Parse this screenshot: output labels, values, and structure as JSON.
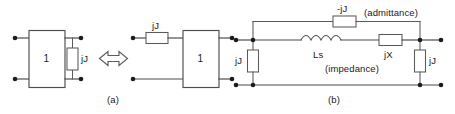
{
  "figure": {
    "type": "circuit-equivalence-diagram",
    "captions": [
      {
        "id": "a",
        "text": "(a)"
      },
      {
        "id": "b",
        "text": "(b)"
      }
    ],
    "colors": {
      "wire": "#4d4d4d",
      "component_outline": "#5a5a5a",
      "node_dot": "#1c1c1c",
      "text": "#1a1a1a",
      "background": "#ffffff"
    }
  },
  "panel_a": {
    "caption": "(a)",
    "left_network": {
      "block_label": "1",
      "shunt_element_label": "jJ",
      "terminal_count": 4
    },
    "equivalence_symbol": "double-headed-arrow",
    "right_network": {
      "block_label": "1",
      "series_element_label": "jJ",
      "terminal_count": 4
    }
  },
  "panel_b": {
    "caption": "(b)",
    "top_branch": {
      "element_label": "-jJ",
      "annotation": "(admittance)"
    },
    "middle_branch": {
      "inductor_label": "Ls",
      "series_element_label": "jX",
      "annotation": "(impedance)"
    },
    "left_shunt": {
      "element_label": "jJ"
    },
    "right_shunt": {
      "element_label": "jJ"
    }
  }
}
